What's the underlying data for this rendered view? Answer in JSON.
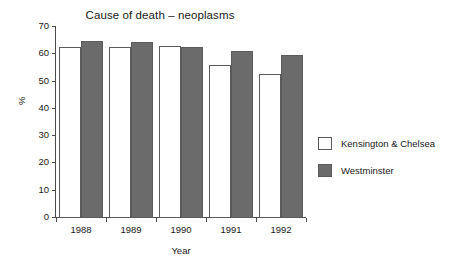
{
  "chart_data": {
    "type": "bar",
    "title": "Cause of death – neoplasms",
    "xlabel": "Year",
    "ylabel": "%",
    "categories": [
      "1988",
      "1989",
      "1990",
      "1991",
      "1992"
    ],
    "series": [
      {
        "name": "Kensington & Chelsea",
        "color": "#ffffff",
        "values": [
          62.7,
          62.5,
          63.2,
          56.1,
          52.8
        ]
      },
      {
        "name": "Westminster",
        "color": "#6b6b6b",
        "values": [
          65.0,
          64.5,
          62.6,
          61.2,
          59.7
        ]
      }
    ],
    "ylim": [
      0,
      70
    ],
    "ytick_labels": [
      "70",
      "60",
      "50",
      "40",
      "30",
      "20",
      "10",
      "0"
    ],
    "yticks": [
      70,
      60,
      50,
      40,
      30,
      20,
      10,
      0
    ],
    "grid": false,
    "legend_position": "right"
  },
  "legend": {
    "entries": [
      {
        "label": "Kensington & Chelsea"
      },
      {
        "label": "Westminster"
      }
    ]
  }
}
